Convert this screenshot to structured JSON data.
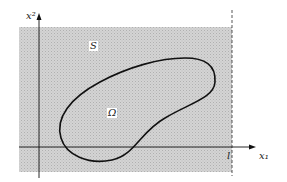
{
  "diagram": {
    "axes": {
      "y_label": "x²",
      "x_label": "x₁",
      "boundary_label": "l"
    },
    "regions": {
      "outer_label": "S",
      "inner_label": "Ω"
    },
    "colors": {
      "shade": "#cfcfcf",
      "shade_dot": "#b4b4b4",
      "line": "#111111",
      "background": "#ffffff"
    }
  }
}
